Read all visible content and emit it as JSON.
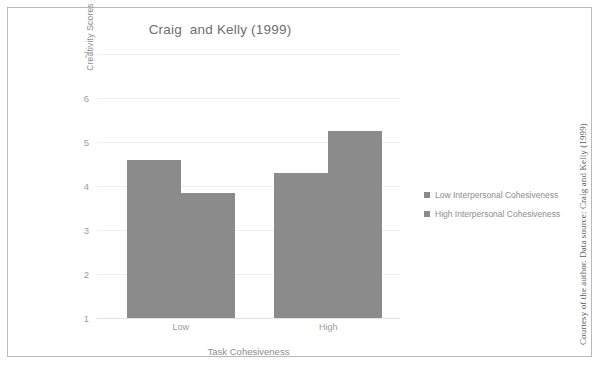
{
  "figure": {
    "background": "#ffffff",
    "frame_color": "#b9b9b9",
    "credit": "Courtesy of the author. Data source: Craig and Kelly (1999)"
  },
  "chart_data": {
    "type": "bar",
    "title": "Craig  and Kelly (1999)",
    "xlabel": "Task Cohesiveness",
    "ylabel": "Creativity Scores",
    "categories": [
      "Low",
      "High"
    ],
    "series": [
      {
        "name": "Low Interpersonal Cohesiveness",
        "values": [
          4.6,
          4.3
        ],
        "color": "#8b8b8b"
      },
      {
        "name": "High Interpersonal Cohesiveness",
        "values": [
          3.85,
          5.25
        ],
        "color": "#8b8b8b"
      }
    ],
    "ylim": [
      1,
      7
    ],
    "yticks": [
      1,
      2,
      3,
      4,
      5,
      6,
      7
    ],
    "ytick_labels": [
      "1",
      "2",
      "3",
      "4",
      "5",
      "6",
      "7"
    ],
    "grid": true,
    "grid_color": "#efefef",
    "legend_position": "right",
    "bar_gap_within_group": 0,
    "bar_outline": "none"
  },
  "legend": {
    "items": [
      {
        "label": "Low Interpersonal Cohesiveness",
        "swatch": "#8b8b8b"
      },
      {
        "label": "High Interpersonal Cohesiveness",
        "swatch": "#8b8b8b"
      }
    ]
  }
}
